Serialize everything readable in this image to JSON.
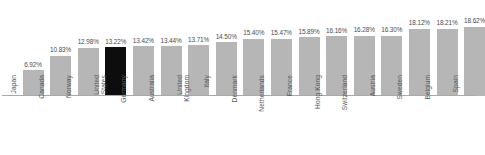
{
  "chart_data": {
    "type": "bar",
    "title": "",
    "subtitle": "",
    "xlabel": "",
    "ylabel": "",
    "grid": false,
    "legend": "none",
    "orientation": "vertical",
    "ylim": [
      0,
      20.5
    ],
    "categories": [
      "Japan",
      "Canada",
      "Norway",
      "United States",
      "Germany",
      "Australia",
      "United Kingdom",
      "Italy",
      "Denmark",
      "Netherlands",
      "France",
      "Hong Kong",
      "Switzerland",
      "Austria",
      "Sweden",
      "Belgium",
      "Spain"
    ],
    "values": [
      6.92,
      10.83,
      12.98,
      13.22,
      13.42,
      13.44,
      13.71,
      14.5,
      15.4,
      15.47,
      15.89,
      16.16,
      16.28,
      16.3,
      18.12,
      18.21,
      18.62
    ],
    "value_labels": [
      "6.92%",
      "10.83%",
      "12.98%",
      "13.22%",
      "13.42%",
      "13.44%",
      "13.71%",
      "14.50%",
      "15.40%",
      "15.47%",
      "15.89%",
      "16.16%",
      "16.28%",
      "16.30%",
      "18.12%",
      "18.21%",
      "18.62%"
    ],
    "highlight_index": 3,
    "colors": {
      "bar": "#b6b6b6",
      "highlight": "#0d0d0d",
      "axis": "#a9a9ab",
      "label_text": "#58585a",
      "value_text": "#4c4c4e",
      "background": "#ffffff"
    }
  },
  "caption": ""
}
